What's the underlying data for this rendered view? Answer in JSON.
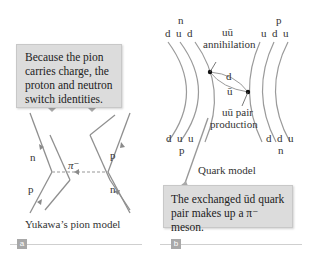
{
  "panel_a": {
    "callout_text": "Because the pion carries charge, the proton and neutron switch identities.",
    "callout_lines": [
      "Because the pion",
      "carries charge, the",
      "proton and neutron",
      "switch identities."
    ],
    "labels": {
      "top_left": "n",
      "top_right": "p",
      "bottom_left": "p",
      "bottom_right": "n",
      "exchange": "π⁻"
    },
    "caption": "Yukawa’s pion model",
    "badge": "a"
  },
  "panel_b": {
    "top_left_particle": "n",
    "top_left_quarks": "d  u  d",
    "top_right_particle": "p",
    "top_right_quarks": "u  d  u",
    "bottom_left_quarks": "d  u  u",
    "bottom_left_particle": "p",
    "bottom_right_quarks": "d  d  u",
    "bottom_right_particle": "n",
    "annihilation_label_1": "uū",
    "annihilation_label_2": "annihilation",
    "exchange_top": "d",
    "exchange_bottom": "ū",
    "production_label_1": "uū pair",
    "production_label_2": "production",
    "caption": "Quark model",
    "callout_lines": [
      "The exchanged ūd quark",
      "pair makes up a π⁻  meson."
    ],
    "badge": "b"
  },
  "colors": {
    "callout_bg": "#dcdcdc",
    "line": "#8a8a8a",
    "badge": "#a8a8a8",
    "rule": "#cfcfcf"
  }
}
